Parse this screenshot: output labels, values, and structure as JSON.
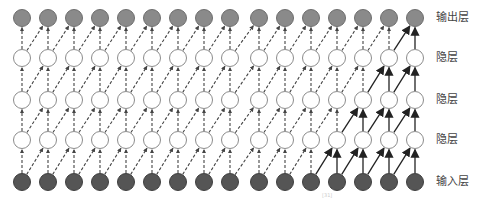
{
  "diagram": {
    "columns": 16,
    "column_x": [
      22,
      48,
      74,
      100,
      126,
      152,
      178,
      204,
      230,
      259,
      285,
      311,
      337,
      363,
      389,
      415
    ],
    "layers": [
      {
        "id": "output",
        "label": "输出层",
        "y": 18,
        "fill": "#8a8a8a",
        "stroke": "#6e6e6e"
      },
      {
        "id": "hidden3",
        "label": "隐层",
        "y": 58,
        "fill": "#ffffff",
        "stroke": "#8c8c8c"
      },
      {
        "id": "hidden2",
        "label": "隐层",
        "y": 100,
        "fill": "#ffffff",
        "stroke": "#8c8c8c"
      },
      {
        "id": "hidden1",
        "label": "隐层",
        "y": 140,
        "fill": "#ffffff",
        "stroke": "#8c8c8c"
      },
      {
        "id": "input",
        "label": "输入层",
        "y": 182,
        "fill": "#555555",
        "stroke": "#3f3f3f"
      }
    ],
    "node_radius": 8.5,
    "dashed_color": "#444444",
    "solid_color": "#222222",
    "solid_edges": [
      {
        "from": [
          11,
          "input"
        ],
        "to": [
          12,
          "hidden1"
        ]
      },
      {
        "from": [
          12,
          "input"
        ],
        "to": [
          12,
          "hidden1"
        ]
      },
      {
        "from": [
          12,
          "input"
        ],
        "to": [
          13,
          "hidden1"
        ]
      },
      {
        "from": [
          13,
          "input"
        ],
        "to": [
          13,
          "hidden1"
        ]
      },
      {
        "from": [
          13,
          "input"
        ],
        "to": [
          14,
          "hidden1"
        ]
      },
      {
        "from": [
          14,
          "input"
        ],
        "to": [
          14,
          "hidden1"
        ]
      },
      {
        "from": [
          14,
          "input"
        ],
        "to": [
          15,
          "hidden1"
        ]
      },
      {
        "from": [
          15,
          "input"
        ],
        "to": [
          15,
          "hidden1"
        ]
      },
      {
        "from": [
          12,
          "hidden1"
        ],
        "to": [
          13,
          "hidden2"
        ]
      },
      {
        "from": [
          13,
          "hidden1"
        ],
        "to": [
          13,
          "hidden2"
        ]
      },
      {
        "from": [
          13,
          "hidden1"
        ],
        "to": [
          14,
          "hidden2"
        ]
      },
      {
        "from": [
          14,
          "hidden1"
        ],
        "to": [
          14,
          "hidden2"
        ]
      },
      {
        "from": [
          14,
          "hidden1"
        ],
        "to": [
          15,
          "hidden2"
        ]
      },
      {
        "from": [
          15,
          "hidden1"
        ],
        "to": [
          15,
          "hidden2"
        ]
      },
      {
        "from": [
          13,
          "hidden2"
        ],
        "to": [
          14,
          "hidden3"
        ]
      },
      {
        "from": [
          14,
          "hidden2"
        ],
        "to": [
          14,
          "hidden3"
        ]
      },
      {
        "from": [
          14,
          "hidden2"
        ],
        "to": [
          15,
          "hidden3"
        ]
      },
      {
        "from": [
          15,
          "hidden2"
        ],
        "to": [
          15,
          "hidden3"
        ]
      },
      {
        "from": [
          14,
          "hidden3"
        ],
        "to": [
          15,
          "output"
        ]
      },
      {
        "from": [
          15,
          "hidden3"
        ],
        "to": [
          15,
          "output"
        ]
      }
    ],
    "citation": "[31]"
  }
}
